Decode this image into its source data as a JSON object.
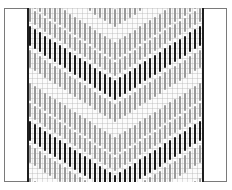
{
  "diagram": {
    "type": "bargello-stitch-chart",
    "columns": 35,
    "column_spacing": 5,
    "repeat_height": 95,
    "colors": {
      "dark": "#1a1a1a",
      "light": "#9a9a9a",
      "grid": "#cccccc",
      "border": "#1e1e1e"
    },
    "bands": [
      {
        "tone": "light",
        "offset": 0,
        "length": 18
      },
      {
        "tone": "light",
        "offset": 20,
        "length": 14
      },
      {
        "tone": "dark",
        "offset": 38,
        "length": 20
      },
      {
        "tone": "light",
        "offset": 62,
        "length": 18
      }
    ],
    "chevron": {
      "shape": "inverted-v",
      "center_column": 17,
      "drop_per_column": 3.2
    }
  }
}
